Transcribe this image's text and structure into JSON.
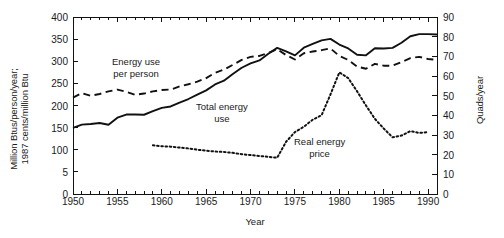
{
  "chart_data": {
    "type": "line",
    "title": "",
    "xlabel": "Year",
    "ylabel_left": "Million Btus/person/year;\n1987 cents/million Btu",
    "ylabel_right": "Quads/year",
    "xlim": [
      1950,
      1991
    ],
    "ylim_left": [
      0,
      400
    ],
    "ylim_right": [
      0,
      90
    ],
    "grid": false,
    "legend_position": "inline-annotations",
    "x_ticks": [
      1950,
      1955,
      1960,
      1965,
      1970,
      1975,
      1980,
      1985,
      1990
    ],
    "x_tick_labels": [
      "1950",
      "1955",
      "1960",
      "1965",
      "1970",
      "1975",
      "1980",
      "1985",
      "1990"
    ],
    "x_minor_tick_interval": 1,
    "y_left_ticks": [
      0,
      50,
      100,
      150,
      200,
      250,
      300,
      350,
      400
    ],
    "y_left_tick_labels": [
      "0",
      "5",
      "100",
      "150",
      "200",
      "250",
      "300",
      "350",
      "400"
    ],
    "y_right_ticks": [
      0,
      10,
      20,
      30,
      40,
      50,
      60,
      70,
      80,
      90
    ],
    "y_right_tick_labels": [
      "0",
      "10",
      "20",
      "30",
      "40",
      "50",
      "60",
      "70",
      "80",
      "90"
    ],
    "annotations": [
      {
        "name": "energy-use-per-person",
        "text": "Energy use\nper person",
        "x_px": 112,
        "y_px": 56
      },
      {
        "name": "total-energy-use",
        "text": "Total energy\nuse",
        "x_px": 196,
        "y_px": 101
      },
      {
        "name": "real-energy-price",
        "text": "Real energy\nprice",
        "x_px": 294,
        "y_px": 136
      }
    ],
    "series": [
      {
        "name": "Energy use per person",
        "style": "dashed",
        "axis": "left",
        "units": "Million Btus/person/year",
        "color": "#111111",
        "x": [
          1950,
          1951,
          1952,
          1953,
          1954,
          1955,
          1956,
          1957,
          1958,
          1959,
          1960,
          1961,
          1962,
          1963,
          1964,
          1965,
          1966,
          1967,
          1968,
          1969,
          1970,
          1971,
          1972,
          1973,
          1974,
          1975,
          1976,
          1977,
          1978,
          1979,
          1980,
          1981,
          1982,
          1983,
          1984,
          1985,
          1986,
          1987,
          1988,
          1989,
          1990,
          1991
        ],
        "values": [
          218,
          228,
          222,
          226,
          232,
          236,
          231,
          224,
          227,
          232,
          235,
          236,
          243,
          248,
          254,
          262,
          274,
          281,
          292,
          303,
          310,
          312,
          319,
          327,
          314,
          304,
          318,
          322,
          325,
          329,
          312,
          303,
          288,
          283,
          294,
          290,
          290,
          298,
          307,
          310,
          305,
          303
        ]
      },
      {
        "name": "Total energy use",
        "style": "solid",
        "axis": "right",
        "units": "Quads/year",
        "color": "#111111",
        "x": [
          1950,
          1951,
          1952,
          1953,
          1954,
          1955,
          1956,
          1957,
          1958,
          1959,
          1960,
          1961,
          1962,
          1963,
          1964,
          1965,
          1966,
          1967,
          1968,
          1969,
          1970,
          1971,
          1972,
          1973,
          1974,
          1975,
          1976,
          1977,
          1978,
          1979,
          1980,
          1981,
          1982,
          1983,
          1984,
          1985,
          1986,
          1987,
          1988,
          1989,
          1990,
          1991
        ],
        "values": [
          33.6,
          35.3,
          35.6,
          36.1,
          35.2,
          38.8,
          40.4,
          40.4,
          40.3,
          42.1,
          43.8,
          44.5,
          46.5,
          48.3,
          50.5,
          52.7,
          55.7,
          57.6,
          61.0,
          64.2,
          66.4,
          67.9,
          71.3,
          74.3,
          72.5,
          70.5,
          74.4,
          76.3,
          78.1,
          78.9,
          76.0,
          74.0,
          70.8,
          70.5,
          74.1,
          74.0,
          74.3,
          76.9,
          80.2,
          81.3,
          81.3,
          81.1
        ]
      },
      {
        "name": "Real energy price",
        "style": "dotted",
        "axis": "left",
        "units": "1987 cents/million Btu",
        "color": "#111111",
        "x": [
          1959,
          1960,
          1961,
          1962,
          1963,
          1964,
          1965,
          1966,
          1967,
          1968,
          1969,
          1970,
          1971,
          1972,
          1973,
          1974,
          1975,
          1976,
          1977,
          1978,
          1979,
          1980,
          1981,
          1982,
          1983,
          1984,
          1985,
          1986,
          1987,
          1988,
          1989,
          1990
        ],
        "values": [
          110,
          108,
          107,
          105,
          103,
          100,
          98,
          96,
          95,
          93,
          90,
          88,
          86,
          84,
          82,
          118,
          140,
          152,
          168,
          178,
          225,
          275,
          262,
          232,
          200,
          170,
          148,
          128,
          132,
          142,
          138,
          140
        ]
      }
    ]
  },
  "figure": {
    "plot_left_px": 73,
    "plot_right_px": 437,
    "plot_top_px": 17,
    "plot_bottom_px": 194
  }
}
